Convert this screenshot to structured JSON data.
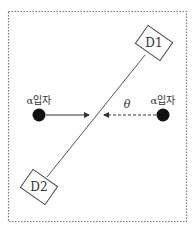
{
  "diagram": {
    "detectors": [
      {
        "id": "d1",
        "label": "D1",
        "cx": 154,
        "cy": 43
      },
      {
        "id": "d2",
        "label": "D2",
        "cx": 39,
        "cy": 187
      }
    ],
    "particles": [
      {
        "id": "left",
        "label": "α입자",
        "cx": 39,
        "cy": 115,
        "arrow_style": "solid"
      },
      {
        "id": "right",
        "label": "α입자",
        "cx": 163,
        "cy": 115,
        "arrow_style": "dashed"
      }
    ],
    "angle_label": "θ",
    "colors": {
      "line": "#555555",
      "particle": "#111111",
      "frame": "#777777",
      "text": "#333333"
    }
  }
}
